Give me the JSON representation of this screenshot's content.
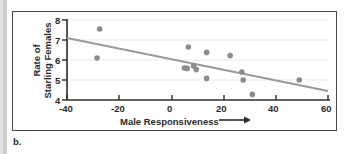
{
  "figure": {
    "panel_letter": "b.",
    "colors": {
      "point": "#8c8c8c",
      "trendline": "#9a9a9a",
      "axis": "#2b2b2b",
      "gridline": "#e8e8e8",
      "frame": "#4a4a4a",
      "gutter": "#cfcfcf"
    }
  },
  "chart_data": {
    "type": "scatter",
    "title": "",
    "xlabel": "Male Responsiveness",
    "ylabel": "Rate of Starling Females",
    "ylabel_line1": "Rate of",
    "ylabel_line2": "Starling Females",
    "xlabel_has_arrow": true,
    "xlim": [
      -40,
      60
    ],
    "ylim": [
      4,
      8
    ],
    "xticks": [
      -40,
      -20,
      0,
      20,
      40,
      60
    ],
    "xticklabels": [
      "-40",
      "-20",
      "0",
      "20",
      "40",
      "60"
    ],
    "yticks": [
      4,
      5,
      6,
      7,
      8
    ],
    "yticklabels": [
      "4",
      "5",
      "6",
      "7",
      "8"
    ],
    "grid": true,
    "grid_axis": "y",
    "legend": null,
    "points": [
      {
        "x": -27.5,
        "y": 7.55
      },
      {
        "x": -28.5,
        "y": 6.1
      },
      {
        "x": 6.5,
        "y": 6.65
      },
      {
        "x": 5.0,
        "y": 5.6
      },
      {
        "x": 6.0,
        "y": 5.58
      },
      {
        "x": 8.5,
        "y": 5.7
      },
      {
        "x": 9.5,
        "y": 5.52
      },
      {
        "x": 13.5,
        "y": 6.38
      },
      {
        "x": 13.5,
        "y": 5.08
      },
      {
        "x": 22.5,
        "y": 6.22
      },
      {
        "x": 27.0,
        "y": 5.4
      },
      {
        "x": 27.5,
        "y": 5.0
      },
      {
        "x": 31.0,
        "y": 4.28
      },
      {
        "x": 49.0,
        "y": 5.0
      }
    ],
    "trendline": {
      "x_start": -40,
      "y_start": 7.1,
      "x_end": 60,
      "y_end": 4.45,
      "slope": -0.0265,
      "intercept": 6.04
    }
  }
}
